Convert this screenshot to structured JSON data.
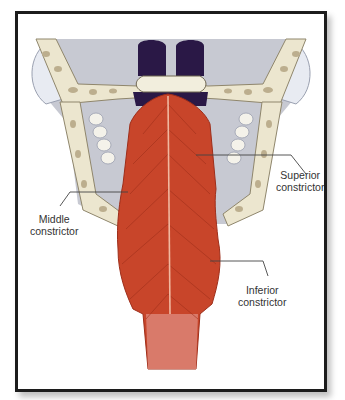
{
  "figure": {
    "labels": [
      {
        "id": "superior",
        "line1": "Superior",
        "line2": "constrictor"
      },
      {
        "id": "middle",
        "line1": "Middle",
        "line2": "constrictor"
      },
      {
        "id": "inferior",
        "line1": "Inferior",
        "line2": "constrictor"
      }
    ]
  },
  "colors": {
    "frame_border": "#1c1c1c",
    "muscle": "#c8452a",
    "muscle_dark": "#9e2e1a",
    "muscle_highlight": "#f0b8a0",
    "bone": "#ece6cf",
    "bone_spots": "#bcae8e",
    "background_tissue": "#c7c9d2",
    "dark_tissue": "#2a1846",
    "leader_line": "#444444",
    "label_text": "#333333"
  }
}
